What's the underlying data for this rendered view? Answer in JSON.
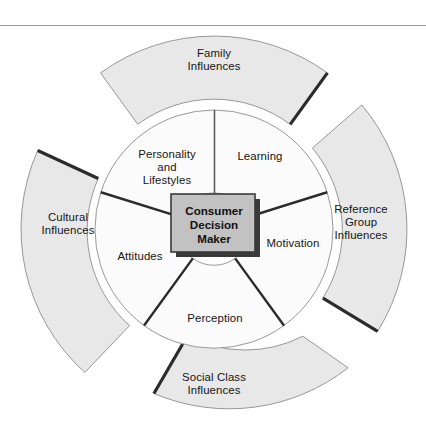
{
  "figure": {
    "has_top_rule": true,
    "background_color": "#ffffff",
    "rule_color": "#9a9a9a"
  },
  "center": {
    "label": "Consumer\nDecision\nMaker",
    "fill_color": "#c2c2c2",
    "border_color": "#3a3a3a",
    "shadow_color": "#3a3a3a"
  },
  "inner_ring": {
    "fill_color": "#fbfbfb",
    "stroke_color": "#8c8c8c",
    "segments": [
      {
        "label": "Learning",
        "start_angle": -90,
        "end_angle": -18
      },
      {
        "label": "Motivation",
        "start_angle": -18,
        "end_angle": 54
      },
      {
        "label": "Perception",
        "start_angle": 54,
        "end_angle": 126
      },
      {
        "label": "Attitudes",
        "start_angle": 126,
        "end_angle": 198
      },
      {
        "label": "Personality\nand\nLifestyles",
        "start_angle": 198,
        "end_angle": 270
      }
    ]
  },
  "outer_ring": {
    "fill_color": "#e8e8e8",
    "stroke_color": "#8c8c8c",
    "shadow_color": "#2b2b2b",
    "segments": [
      {
        "label": "Family\nInfluences",
        "start_angle": -126,
        "end_angle": -54
      },
      {
        "label": "Reference\nGroup\nInfluences",
        "start_angle": -40,
        "end_angle": 32
      },
      {
        "label": "Social Class\nInfluences",
        "start_angle": 46,
        "end_angle": 118
      },
      {
        "label": "Cultural\nInfluences",
        "start_angle": 132,
        "end_angle": 204
      }
    ]
  },
  "geometry": {
    "center_x": 214,
    "center_y": 229,
    "outer_radius": 193,
    "outer_inner_radius": 128,
    "inner_radius": 119,
    "inner_hub_radius": 36
  }
}
